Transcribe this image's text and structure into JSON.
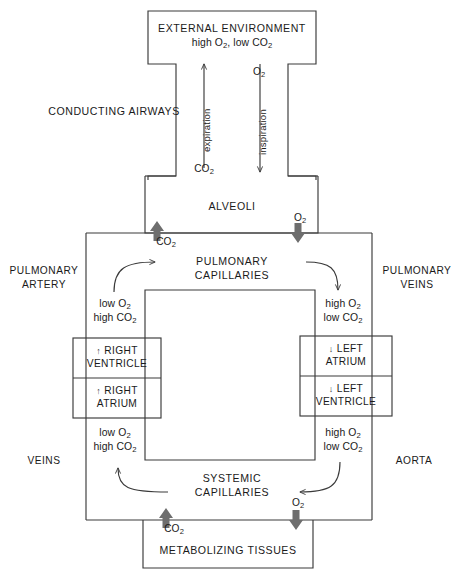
{
  "diagram": {
    "colors": {
      "line": "#3a3a3a",
      "text": "#1a1a1a",
      "gas_arrow_fill": "#6e6e6e",
      "background": "#ffffff"
    },
    "boxes": {
      "external_environment": {
        "line1": "EXTERNAL ENVIRONMENT",
        "line2_prefix": "high O",
        "line2_sub1": "2",
        "line2_mid": ", low CO",
        "line2_sub2": "2"
      },
      "conducting_airways": {
        "label": "CONDUCTING AIRWAYS"
      },
      "alveoli": {
        "label": "ALVEOLI"
      },
      "pulmonary_capillaries": {
        "line1": "PULMONARY",
        "line2": "CAPILLARIES"
      },
      "systemic_capillaries": {
        "line1": "SYSTEMIC",
        "line2": "CAPILLARIES"
      },
      "metabolizing_tissues": {
        "label": "METABOLIZING TISSUES"
      }
    },
    "vessels": {
      "pulmonary_artery": {
        "line1": "PULMONARY",
        "line2": "ARTERY"
      },
      "pulmonary_veins": {
        "line1": "PULMONARY",
        "line2": "VEINS"
      },
      "veins": {
        "label": "VEINS"
      },
      "aorta": {
        "label": "AORTA"
      }
    },
    "heart": {
      "right_ventricle": {
        "arrow": "up",
        "line1": "RIGHT",
        "line2": "VENTRICLE"
      },
      "right_atrium": {
        "arrow": "up",
        "line1": "RIGHT",
        "line2": "ATRIUM"
      },
      "left_atrium": {
        "arrow": "down",
        "line1": "LEFT",
        "line2": "ATRIUM"
      },
      "left_ventricle": {
        "arrow": "down",
        "line1": "LEFT",
        "line2": "VENTRICLE"
      }
    },
    "breathing": {
      "expiration": {
        "label": "expiration",
        "direction": "up"
      },
      "inspiration": {
        "label": "inspiration",
        "direction": "down"
      }
    },
    "gases": {
      "o2_external": {
        "formula": "O",
        "sub": "2"
      },
      "co2_airway": {
        "formula": "CO",
        "sub": "2"
      },
      "co2_alveolar": {
        "formula": "CO",
        "sub": "2"
      },
      "o2_alveolar": {
        "formula": "O",
        "sub": "2"
      },
      "co2_tissue": {
        "formula": "CO",
        "sub": "2"
      },
      "o2_tissue": {
        "formula": "O",
        "sub": "2"
      }
    },
    "blood_states": {
      "pulmonary_artery_blood": {
        "line1_prefix": "low O",
        "line1_sub": "2",
        "line2_prefix": "high CO",
        "line2_sub": "2"
      },
      "pulmonary_vein_blood": {
        "line1_prefix": "high O",
        "line1_sub": "2",
        "line2_prefix": "low CO",
        "line2_sub": "2"
      },
      "systemic_vein_blood": {
        "line1_prefix": "low O",
        "line1_sub": "2",
        "line2_prefix": "high CO",
        "line2_sub": "2"
      },
      "systemic_artery_blood": {
        "line1_prefix": "high O",
        "line1_sub": "2",
        "line2_prefix": "low CO",
        "line2_sub": "2"
      }
    },
    "icons": {
      "gas_up_arrow": "gas-exchange-up-arrow",
      "gas_down_arrow": "gas-exchange-down-arrow",
      "flow_arrow": "blood-flow-arrow"
    }
  }
}
